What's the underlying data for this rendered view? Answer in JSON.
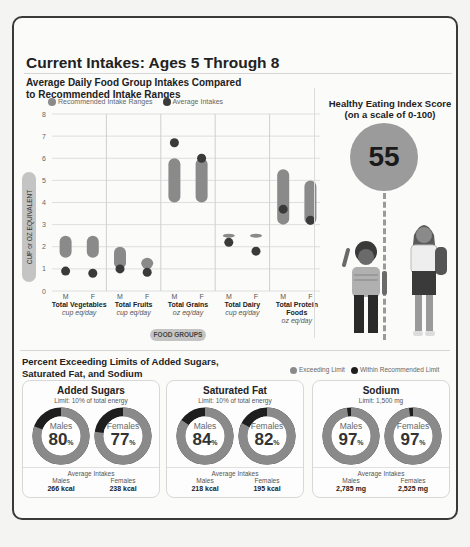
{
  "title": "Current Intakes: Ages 5 Through 8",
  "chart_section": {
    "subtitle": "Average Daily Food Group Intakes Compared to Recommended Intake Ranges",
    "legend": [
      {
        "label": "Recommended Intake Ranges",
        "color": "#8a8a8a"
      },
      {
        "label": "Average Intakes",
        "color": "#3a3a3a"
      }
    ],
    "y_axis_label": "CUP or OZ EQUIVALENT",
    "x_axis_label": "FOOD GROUPS",
    "categories": [
      {
        "name": "Total Vegetables",
        "unit": "cup eq/day"
      },
      {
        "name": "Total Fruits",
        "unit": "cup eq/day"
      },
      {
        "name": "Total Grains",
        "unit": "oz eq/day"
      },
      {
        "name": "Total Dairy",
        "unit": "cup eq/day"
      },
      {
        "name": "Total Protein Foods",
        "unit": "oz eq/day"
      }
    ],
    "sex_labels": [
      "M",
      "F"
    ]
  },
  "chart_data": {
    "type": "range-dot",
    "title": "Average Daily Food Group Intakes Compared to Recommended Intake Ranges",
    "xlabel": "FOOD GROUPS",
    "ylabel": "CUP or OZ EQUIVALENT",
    "ylim": [
      0,
      8
    ],
    "yticks": [
      0,
      1,
      2,
      3,
      4,
      5,
      6,
      7,
      8
    ],
    "grid": true,
    "legend_position": "top",
    "categories": [
      "Total Vegetables",
      "Total Fruits",
      "Total Grains",
      "Total Dairy",
      "Total Protein Foods"
    ],
    "series": [
      {
        "name": "Recommended Intake Ranges (Males)",
        "values": [
          [
            1.5,
            2.5
          ],
          [
            1.0,
            2.0
          ],
          [
            4.0,
            6.0
          ],
          [
            2.5,
            2.5
          ],
          [
            3.0,
            5.5
          ]
        ]
      },
      {
        "name": "Recommended Intake Ranges (Females)",
        "values": [
          [
            1.5,
            2.5
          ],
          [
            1.0,
            1.5
          ],
          [
            4.0,
            6.0
          ],
          [
            2.5,
            2.5
          ],
          [
            3.0,
            5.0
          ]
        ]
      },
      {
        "name": "Average Intakes (Males)",
        "values": [
          0.9,
          1.0,
          6.7,
          2.2,
          3.7
        ]
      },
      {
        "name": "Average Intakes (Females)",
        "values": [
          0.8,
          0.85,
          6.0,
          1.8,
          3.2
        ]
      }
    ]
  },
  "hei": {
    "title": "Healthy Eating Index Score",
    "subtitle": "(on a scale of 0-100)",
    "score": "55"
  },
  "limits_section": {
    "title": "Percent Exceeding Limits of Added Sugars, Saturated Fat, and Sodium",
    "legend": [
      {
        "label": "Exceeding Limit",
        "color": "#8a8a8a"
      },
      {
        "label": "Within Recommended Limit",
        "color": "#1e1e1e"
      }
    ],
    "avg_label": "Average Intakes",
    "boxes": [
      {
        "name": "Added Sugars",
        "limit": "Limit: 10% of total energy",
        "males": {
          "label": "Males",
          "pct": "80",
          "avg": "266 kcal"
        },
        "females": {
          "label": "Females",
          "pct": "77",
          "avg": "238 kcal"
        }
      },
      {
        "name": "Saturated Fat",
        "limit": "Limit: 10% of total energy",
        "males": {
          "label": "Males",
          "pct": "84",
          "avg": "218 kcal"
        },
        "females": {
          "label": "Females",
          "pct": "82",
          "avg": "195 kcal"
        }
      },
      {
        "name": "Sodium",
        "limit": "Limit: 1,500 mg",
        "males": {
          "label": "Males",
          "pct": "97",
          "avg": "2,785 mg"
        },
        "females": {
          "label": "Females",
          "pct": "97",
          "avg": "2,525 mg"
        }
      }
    ],
    "pct_sign": "%"
  }
}
